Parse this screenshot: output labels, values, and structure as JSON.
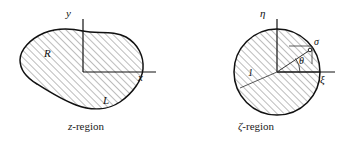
{
  "figure": {
    "type": "diagram",
    "width": 342,
    "height": 143,
    "background": "#ffffff",
    "stroke_color": "#111111",
    "hatch_color": "#666666",
    "panels": [
      {
        "id": "z-panel",
        "caption_prefix": "z",
        "caption_suffix": "-region",
        "shape": "closed-blob",
        "axes": {
          "vertical_label": "y",
          "horizontal_label": "x",
          "origin_x": 83,
          "origin_y": 72
        },
        "annotations": [
          {
            "name": "region-label",
            "text": "R",
            "x": 46,
            "y": 49
          },
          {
            "name": "boundary-curve-label",
            "text": "L",
            "x": 104,
            "y": 96
          }
        ]
      },
      {
        "id": "zeta-panel",
        "caption_prefix": "ζ",
        "caption_suffix": "-region",
        "shape": "unit-circle",
        "axes": {
          "vertical_label": "η",
          "horizontal_label": "ξ",
          "origin_x": 277,
          "origin_y": 72,
          "radius": 43
        },
        "annotations": [
          {
            "name": "unit-radius-label",
            "text": "1",
            "x": 250,
            "y": 73
          },
          {
            "name": "angle-label",
            "text": "θ",
            "x": 300,
            "y": 60
          },
          {
            "name": "boundary-point-label",
            "text": "σ",
            "x": 315,
            "y": 41
          }
        ]
      }
    ]
  },
  "captions": {
    "left_prefix": "z",
    "left_suffix": "-region",
    "right_prefix": "ζ",
    "right_suffix": "-region"
  },
  "labels": {
    "y_axis": "y",
    "x_axis": "x",
    "eta_axis": "η",
    "xi_axis": "ξ",
    "region_R": "R",
    "curve_L": "L",
    "unit_one": "1",
    "theta": "θ",
    "sigma": "σ"
  },
  "colors": {
    "stroke": "#111111",
    "hatch": "#6b6b6b",
    "background": "#ffffff",
    "text": "#1a1a1a"
  }
}
